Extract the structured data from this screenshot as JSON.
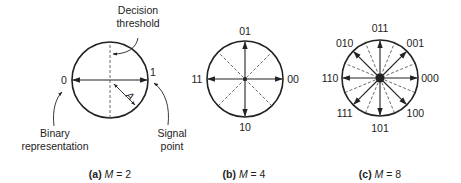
{
  "diagrams": [
    {
      "id": "a",
      "caption": {
        "prefix": "(a)",
        "var": "M",
        "eq": " = 2"
      },
      "points": [
        {
          "label": "0",
          "angle_deg": 180
        },
        {
          "label": "1",
          "angle_deg": 0
        }
      ],
      "thresholds_deg": [
        90
      ],
      "annotations": {
        "decision_threshold": [
          "Decision",
          "threshold"
        ],
        "binary_representation": [
          "Binary",
          "representation"
        ],
        "signal_point": [
          "Signal",
          "point"
        ],
        "amplitude": "A"
      }
    },
    {
      "id": "b",
      "caption": {
        "prefix": "(b)",
        "var": "M",
        "eq": " = 4"
      },
      "points": [
        {
          "label": "00",
          "angle_deg": 0
        },
        {
          "label": "01",
          "angle_deg": 90
        },
        {
          "label": "11",
          "angle_deg": 180
        },
        {
          "label": "10",
          "angle_deg": 270
        }
      ],
      "thresholds_deg": [
        45,
        135
      ]
    },
    {
      "id": "c",
      "caption": {
        "prefix": "(c)",
        "var": "M",
        "eq": " = 8"
      },
      "points": [
        {
          "label": "000",
          "angle_deg": 0
        },
        {
          "label": "001",
          "angle_deg": 45
        },
        {
          "label": "011",
          "angle_deg": 90
        },
        {
          "label": "010",
          "angle_deg": 135
        },
        {
          "label": "110",
          "angle_deg": 180
        },
        {
          "label": "111",
          "angle_deg": 225
        },
        {
          "label": "101",
          "angle_deg": 270
        },
        {
          "label": "100",
          "angle_deg": 315
        }
      ],
      "thresholds_deg": [
        22.5,
        67.5,
        112.5,
        157.5
      ]
    }
  ]
}
